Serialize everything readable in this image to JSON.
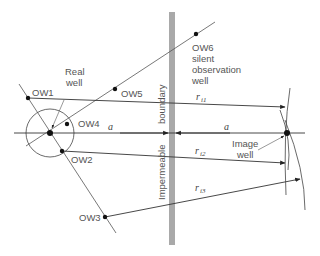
{
  "diagram": {
    "labels": {
      "real_well": [
        "Real",
        "well"
      ],
      "image_well": [
        "Image",
        "well"
      ],
      "ow1": "OW1",
      "ow2": "OW2",
      "ow3": "OW3",
      "ow4": "OW4",
      "ow5": "OW5",
      "ow6": [
        "OW6",
        "silent",
        "observation",
        "well"
      ],
      "boundary_top": "boundary",
      "boundary_bottom": "Impermeable",
      "distance_left": "a",
      "distance_right": "a",
      "r1": "r",
      "r1_sub": "i1",
      "r2": "r",
      "r2_sub": "i2",
      "r3": "r",
      "r3_sub": "i3"
    },
    "colors": {
      "line": "#333333",
      "boundary": "#a9a9a9",
      "text": "#555555",
      "point": "#111111"
    }
  }
}
